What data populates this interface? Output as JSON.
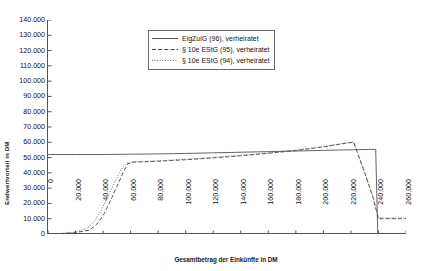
{
  "chart_data": {
    "type": "line",
    "title": "",
    "xlabel": "Gesamtbetrag der Einkünfte in DM",
    "ylabel": "Endwertvorteil in DM",
    "xlim": [
      0,
      260000
    ],
    "ylim": [
      0,
      140000
    ],
    "grid": false,
    "legend_position": "top-center",
    "xticks": [
      "0",
      "20.000",
      "40.000",
      "60.000",
      "80.000",
      "100.000",
      "120.000",
      "140.000",
      "160.000",
      "180.000",
      "200.000",
      "220.000",
      "240.000",
      "260.000"
    ],
    "xtick_values": [
      0,
      20000,
      40000,
      60000,
      80000,
      100000,
      120000,
      140000,
      160000,
      180000,
      200000,
      220000,
      240000,
      260000
    ],
    "yticks": [
      "0",
      "10.000",
      "20.000",
      "30.000",
      "40.000",
      "50.000",
      "60.000",
      "70.000",
      "80.000",
      "90.000",
      "100.000",
      "110.000",
      "120.000",
      "130.000",
      "140.000"
    ],
    "ytick_values": [
      0,
      10000,
      20000,
      30000,
      40000,
      50000,
      60000,
      70000,
      80000,
      90000,
      100000,
      110000,
      120000,
      130000,
      140000
    ],
    "series": [
      {
        "name": "EigZulG (96), verheiratet",
        "style": "solid",
        "color": "#555555",
        "points": [
          [
            0,
            52000
          ],
          [
            20000,
            52000
          ],
          [
            40000,
            52000
          ],
          [
            60000,
            52200
          ],
          [
            80000,
            52400
          ],
          [
            100000,
            52700
          ],
          [
            120000,
            53100
          ],
          [
            140000,
            53500
          ],
          [
            160000,
            53900
          ],
          [
            180000,
            54300
          ],
          [
            200000,
            54700
          ],
          [
            220000,
            55100
          ],
          [
            238000,
            55400
          ],
          [
            239500,
            0
          ],
          [
            260000,
            0
          ]
        ]
      },
      {
        "name": "§ 10e EStG (95), verheiratet",
        "style": "dashed",
        "color": "#444444",
        "points": [
          [
            0,
            0
          ],
          [
            10000,
            300
          ],
          [
            20000,
            900
          ],
          [
            30000,
            2500
          ],
          [
            35000,
            6000
          ],
          [
            40000,
            12000
          ],
          [
            45000,
            21000
          ],
          [
            50000,
            31000
          ],
          [
            55000,
            41000
          ],
          [
            58000,
            46000
          ],
          [
            62000,
            47000
          ],
          [
            80000,
            47600
          ],
          [
            100000,
            48600
          ],
          [
            120000,
            49800
          ],
          [
            140000,
            51200
          ],
          [
            160000,
            52800
          ],
          [
            180000,
            54600
          ],
          [
            200000,
            57000
          ],
          [
            215000,
            59200
          ],
          [
            222000,
            60000
          ],
          [
            230000,
            40000
          ],
          [
            236000,
            24000
          ],
          [
            240000,
            10000
          ],
          [
            260000,
            10000
          ]
        ]
      },
      {
        "name": "§ 10e EStG (94), verheiratet",
        "style": "dotted",
        "color": "#666666",
        "points": [
          [
            0,
            0
          ],
          [
            10000,
            400
          ],
          [
            20000,
            1300
          ],
          [
            28000,
            3500
          ],
          [
            33000,
            7500
          ],
          [
            38000,
            14500
          ],
          [
            43000,
            23500
          ],
          [
            48000,
            33000
          ],
          [
            53000,
            42000
          ],
          [
            57000,
            46500
          ],
          [
            62000,
            47200
          ],
          [
            80000,
            47900
          ],
          [
            100000,
            48900
          ],
          [
            120000,
            50100
          ],
          [
            140000,
            51500
          ],
          [
            160000,
            53100
          ],
          [
            180000,
            54900
          ],
          [
            200000,
            57300
          ],
          [
            215000,
            59400
          ],
          [
            222000,
            60200
          ],
          [
            230000,
            40500
          ],
          [
            236000,
            24500
          ],
          [
            240000,
            10500
          ],
          [
            260000,
            10500
          ]
        ]
      }
    ]
  }
}
